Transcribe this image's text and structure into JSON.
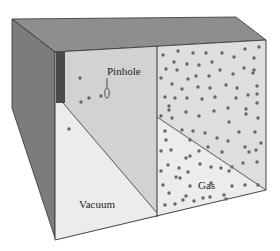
{
  "diagram": {
    "title": "",
    "labels": {
      "pinhole": "Pinhole",
      "vacuum": "Vacuum",
      "gas": "Gas"
    },
    "colors": {
      "top_face": "#8c8c8c",
      "left_face": "#7e7e7e",
      "dark_strip": "#4a4a4a",
      "vacuum_upper": "#d2d2d2",
      "vacuum_lower": "#ececec",
      "gas_upper": "#dedede",
      "gas_lower": "#ececec",
      "molecule": "#666666",
      "edge": "#333333"
    },
    "vacuum_molecules": [
      [
        80,
        78
      ],
      [
        101,
        96
      ],
      [
        89,
        98
      ],
      [
        81,
        102
      ],
      [
        69,
        129
      ]
    ],
    "gas_molecules": [
      [
        163,
        55
      ],
      [
        178,
        51
      ],
      [
        193,
        53
      ],
      [
        206,
        53
      ],
      [
        222,
        53
      ],
      [
        245,
        49
      ],
      [
        259,
        47
      ],
      [
        174,
        62
      ],
      [
        187,
        64
      ],
      [
        199,
        65
      ],
      [
        212,
        62
      ],
      [
        234,
        57
      ],
      [
        254,
        58
      ],
      [
        166,
        69
      ],
      [
        177,
        70
      ],
      [
        196,
        76
      ],
      [
        220,
        70
      ],
      [
        244,
        68
      ],
      [
        254,
        70
      ],
      [
        161,
        78
      ],
      [
        188,
        79
      ],
      [
        209,
        76
      ],
      [
        233,
        74
      ],
      [
        253,
        73
      ],
      [
        172,
        84
      ],
      [
        182,
        89
      ],
      [
        198,
        87
      ],
      [
        210,
        88
      ],
      [
        226,
        85
      ],
      [
        237,
        88
      ],
      [
        257,
        86
      ],
      [
        165,
        97
      ],
      [
        175,
        98
      ],
      [
        187,
        98
      ],
      [
        202,
        99
      ],
      [
        215,
        97
      ],
      [
        236,
        98
      ],
      [
        248,
        95
      ],
      [
        257,
        94
      ],
      [
        169,
        106
      ],
      [
        186,
        112
      ],
      [
        214,
        111
      ],
      [
        228,
        108
      ],
      [
        246,
        109
      ],
      [
        257,
        103
      ],
      [
        161,
        116
      ],
      [
        169,
        110
      ],
      [
        172,
        118
      ],
      [
        199,
        116
      ],
      [
        229,
        122
      ],
      [
        246,
        114
      ],
      [
        258,
        118
      ],
      [
        165,
        131
      ],
      [
        182,
        130
      ],
      [
        193,
        131
      ],
      [
        205,
        133
      ],
      [
        217,
        138
      ],
      [
        239,
        132
      ],
      [
        255,
        132
      ],
      [
        166,
        140
      ],
      [
        190,
        140
      ],
      [
        208,
        147
      ],
      [
        228,
        141
      ],
      [
        245,
        147
      ],
      [
        261,
        143
      ],
      [
        161,
        151
      ],
      [
        171,
        150
      ],
      [
        190,
        156
      ],
      [
        199,
        151
      ],
      [
        222,
        152
      ],
      [
        249,
        152
      ],
      [
        256,
        150
      ],
      [
        168,
        165
      ],
      [
        179,
        168
      ],
      [
        186,
        158
      ],
      [
        200,
        164
      ],
      [
        211,
        167
      ],
      [
        221,
        168
      ],
      [
        232,
        167
      ],
      [
        243,
        163
      ],
      [
        257,
        162
      ],
      [
        161,
        171
      ],
      [
        176,
        177
      ],
      [
        188,
        172
      ],
      [
        229,
        171
      ],
      [
        163,
        185
      ],
      [
        180,
        178
      ],
      [
        190,
        186
      ],
      [
        211,
        183
      ],
      [
        232,
        186
      ],
      [
        245,
        185
      ],
      [
        258,
        185
      ],
      [
        169,
        193
      ],
      [
        186,
        196
      ],
      [
        203,
        198
      ],
      [
        224,
        195
      ],
      [
        165,
        205
      ],
      [
        175,
        204
      ],
      [
        183,
        200
      ],
      [
        194,
        201
      ],
      [
        210,
        197
      ],
      [
        226,
        199
      ]
    ]
  }
}
